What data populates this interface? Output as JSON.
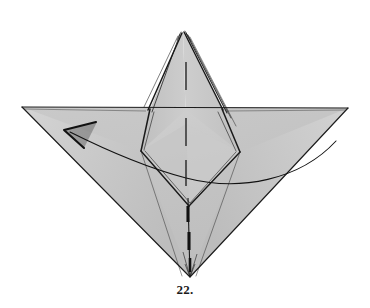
{
  "figure": {
    "caption": "22.",
    "kind": "origami-folding-diagram",
    "step_number": 22,
    "background_color": "#ffffff",
    "paper_fill_color": "#c8c8c8",
    "paper_fill_shadow_color": "#b4b4b4",
    "paper_fill_highlight_color": "#d6d6d6",
    "line_color": "#1a1a1a",
    "crease_color": "#2b2b2b",
    "arrow_color": "#111111"
  },
  "geometry": {
    "apex_top": {
      "x": 183,
      "y": 32
    },
    "bottom_tip": {
      "x": 190,
      "y": 277
    },
    "left_wing_tip": {
      "x": 22,
      "y": 107
    },
    "right_wing_tip": {
      "x": 348,
      "y": 108
    },
    "diamond_left_vertex": {
      "x": 141,
      "y": 151
    },
    "diamond_right_vertex": {
      "x": 240,
      "y": 152
    },
    "horizontal_fold_y": 109,
    "center_axis_x": 186
  },
  "annotations": {
    "arrow": {
      "name": "fold-direction-arrow",
      "description": "curved arrow sweeping from right wing to left wing",
      "tip": {
        "x": 64,
        "y": 130
      },
      "tail": {
        "x": 336,
        "y": 141
      }
    },
    "valley_creases": [
      {
        "label": "upper-center-crease",
        "x": 186,
        "y1": 62,
        "y2": 90
      },
      {
        "label": "mid-center-crease",
        "x": 186,
        "y1": 118,
        "y2": 146
      },
      {
        "label": "lower-center-crease",
        "x": 186,
        "y1": 160,
        "y2": 186
      }
    ],
    "mountain_spine": {
      "label": "bottom-spine",
      "x": 188,
      "y1": 198,
      "y2": 276
    }
  }
}
